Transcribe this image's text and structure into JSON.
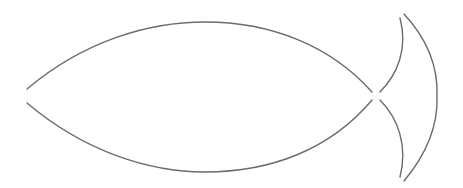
{
  "figure": {
    "background": "#ffffff",
    "line_color": "#6b6b6b",
    "line_width": 1.4,
    "parts": [
      {
        "name": "body-upper-curve",
        "d": "M 27 89 C 85 40, 150 22, 205 22 C 270 22, 330 45, 372 92"
      },
      {
        "name": "body-lower-curve",
        "d": "M 27 103 C 85 152, 150 172, 205 172 C 270 172, 330 150, 372 100"
      },
      {
        "name": "tail-inner-upper-curve",
        "d": "M 380 92 C 398 74, 408 48, 400 18"
      },
      {
        "name": "tail-inner-lower-curve",
        "d": "M 380 100 C 398 118, 408 146, 400 177"
      },
      {
        "name": "tail-outer-arc",
        "d": "M 404 14 C 430 42, 438 70, 437 96 C 438 122, 430 150, 404 181"
      }
    ]
  }
}
